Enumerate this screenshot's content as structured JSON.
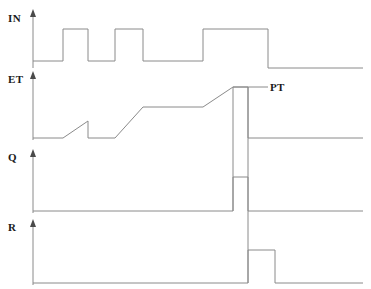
{
  "diagram": {
    "kind": "timing-diagram",
    "width": 371,
    "height": 289,
    "background_color": "#ffffff",
    "line_color": "#8a8a8a",
    "text_color": "#1a1a1a"
  },
  "labels": {
    "in": "IN",
    "et": "ET",
    "q": "Q",
    "r": "R",
    "pt": "PT"
  },
  "chart_data": {
    "type": "line",
    "xlabel": "",
    "ylabel": "",
    "grid": false,
    "legend": "none",
    "axis_style": "arrow-up-left-origin",
    "series": [
      {
        "name": "IN",
        "label": "IN",
        "kind": "digital",
        "baseline_y": 61,
        "high_y": 29,
        "axis_top_y": 12,
        "axis_x": 33,
        "start_x": 33,
        "end_x": 363,
        "pulses": [
          {
            "rise_x": 63,
            "fall_x": 88
          },
          {
            "rise_x": 115,
            "fall_x": 143
          },
          {
            "rise_x": 203,
            "fall_x": 268
          }
        ],
        "points": [
          [
            33,
            61
          ],
          [
            63,
            61
          ],
          [
            63,
            29
          ],
          [
            88,
            29
          ],
          [
            88,
            61
          ],
          [
            115,
            61
          ],
          [
            115,
            29
          ],
          [
            143,
            29
          ],
          [
            143,
            61
          ],
          [
            203,
            61
          ],
          [
            203,
            29
          ],
          [
            268,
            29
          ],
          [
            268,
            68
          ],
          [
            363,
            68
          ]
        ]
      },
      {
        "name": "ET",
        "label": "ET",
        "kind": "ramp",
        "baseline_y": 138,
        "peak_y": 87,
        "axis_top_y": 74,
        "axis_x": 33,
        "start_x": 33,
        "end_x": 363,
        "pt_level_y": 87,
        "points": [
          [
            33,
            138
          ],
          [
            63,
            138
          ],
          [
            88,
            121
          ],
          [
            88,
            138
          ],
          [
            115,
            138
          ],
          [
            143,
            107
          ],
          [
            203,
            107
          ],
          [
            233,
            87
          ],
          [
            248,
            87
          ],
          [
            248,
            138
          ],
          [
            363,
            138
          ]
        ],
        "drop_to_zero_x": 248
      },
      {
        "name": "Q",
        "label": "Q",
        "kind": "digital",
        "baseline_y": 211,
        "high_y": 177,
        "axis_top_y": 152,
        "axis_x": 33,
        "start_x": 33,
        "end_x": 363,
        "pulses": [
          {
            "rise_x": 233,
            "fall_x": 248
          }
        ],
        "points": [
          [
            33,
            211
          ],
          [
            233,
            211
          ],
          [
            233,
            177
          ],
          [
            248,
            177
          ],
          [
            248,
            211
          ],
          [
            363,
            211
          ]
        ]
      },
      {
        "name": "R",
        "label": "R",
        "kind": "digital",
        "baseline_y": 283,
        "high_y": 250,
        "axis_top_y": 222,
        "axis_x": 33,
        "start_x": 33,
        "end_x": 363,
        "pulses": [
          {
            "rise_x": 248,
            "fall_x": 275
          }
        ],
        "points": [
          [
            33,
            283
          ],
          [
            248,
            283
          ],
          [
            248,
            250
          ],
          [
            275,
            250
          ],
          [
            275,
            283
          ],
          [
            363,
            283
          ]
        ]
      }
    ],
    "annotations": [
      {
        "name": "PT",
        "text": "PT",
        "leader_from_x": 233,
        "leader_to_x": 268,
        "leader_y": 87,
        "text_x": 270,
        "text_y": 82
      }
    ],
    "connectors": [
      {
        "name": "et-to-q-drop",
        "x": 233,
        "from_y": 87,
        "to_y": 211
      },
      {
        "name": "et-reset-drop",
        "x": 248,
        "from_y": 87,
        "to_y": 283
      }
    ]
  }
}
